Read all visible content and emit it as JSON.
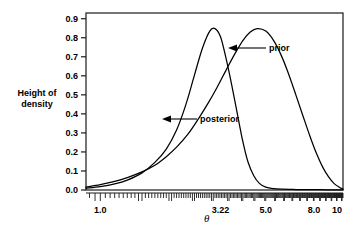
{
  "chart_data": {
    "type": "line",
    "title": "",
    "subtitle": "",
    "xlabel": "θ",
    "ylabel": "Height of density",
    "ylabel_line1": "Height of",
    "ylabel_line2": "density",
    "xscale": "log",
    "xlim": [
      0.87,
      10.6
    ],
    "ylim": [
      0.0,
      0.93
    ],
    "grid": false,
    "legend_position": "inline-annotations",
    "y_ticks": [
      "0.0",
      "0.1",
      "0.2",
      "0.3",
      "0.4",
      "0.5",
      "0.6",
      "0.7",
      "0.8",
      "0.9"
    ],
    "y_tick_values": [
      0.0,
      0.1,
      0.2,
      0.3,
      0.4,
      0.5,
      0.6,
      0.7,
      0.8,
      0.9
    ],
    "x_ticks": [
      "1.0",
      "3.22",
      "5.0",
      "8.0",
      "10"
    ],
    "x_tick_values": [
      1.0,
      3.22,
      5.0,
      8.0,
      10
    ],
    "annotations": [
      {
        "text": "prior",
        "points_to": "prior-curve-right-flank"
      },
      {
        "text": "posterior",
        "points_to": "posterior-curve-right-flank"
      }
    ],
    "series": [
      {
        "name": "prior",
        "color": "#000000",
        "x": [
          0.87,
          1.0,
          1.15,
          1.3,
          1.5,
          1.7,
          1.9,
          2.1,
          2.35,
          2.6,
          2.85,
          3.1,
          3.4,
          3.7,
          4.0,
          4.3,
          4.6,
          5.0,
          5.4,
          5.8,
          6.2,
          6.7,
          7.2,
          7.7,
          8.2,
          8.7,
          9.2,
          9.7,
          10.3,
          10.6
        ],
        "y": [
          0.015,
          0.028,
          0.045,
          0.065,
          0.095,
          0.13,
          0.175,
          0.225,
          0.295,
          0.375,
          0.455,
          0.535,
          0.63,
          0.715,
          0.785,
          0.83,
          0.848,
          0.835,
          0.785,
          0.71,
          0.62,
          0.5,
          0.385,
          0.28,
          0.19,
          0.12,
          0.07,
          0.035,
          0.012,
          0.005
        ]
      },
      {
        "name": "posterior",
        "color": "#000000",
        "x": [
          0.87,
          1.0,
          1.15,
          1.3,
          1.5,
          1.7,
          1.9,
          2.1,
          2.3,
          2.5,
          2.7,
          2.9,
          3.05,
          3.22,
          3.4,
          3.6,
          3.8,
          4.0,
          4.2,
          4.45,
          4.7,
          5.0,
          5.4,
          5.9,
          6.5,
          7.2,
          8.0,
          9.0,
          10.0,
          10.6
        ],
        "y": [
          0.01,
          0.018,
          0.032,
          0.052,
          0.09,
          0.145,
          0.215,
          0.315,
          0.45,
          0.605,
          0.745,
          0.835,
          0.848,
          0.805,
          0.69,
          0.545,
          0.395,
          0.255,
          0.15,
          0.075,
          0.035,
          0.015,
          0.007,
          0.004,
          0.003,
          0.002,
          0.002,
          0.001,
          0.001,
          0.001
        ]
      }
    ]
  },
  "axis": {
    "y_title_line1": "Height of",
    "y_title_line2": "density",
    "x_title": "θ"
  },
  "labels": {
    "prior": "prior",
    "posterior": "posterior"
  },
  "colors": {
    "curve": "#000000",
    "frame": "#1a1a1a",
    "background": "#ffffff"
  }
}
